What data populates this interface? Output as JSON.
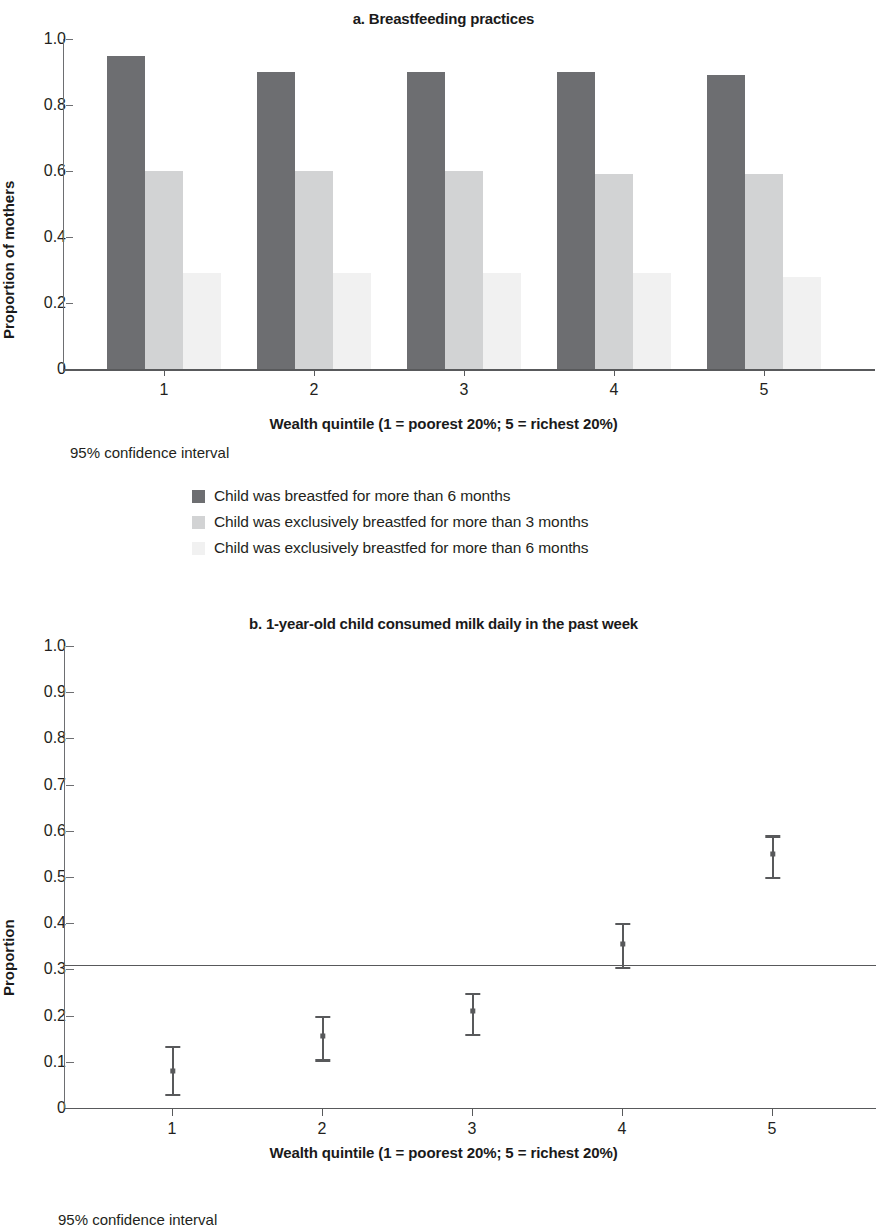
{
  "chart_data": [
    {
      "type": "bar",
      "panel_id": "a",
      "title": "a. Breastfeeding practices",
      "xlabel": "Wealth quintile (1 = poorest 20%; 5 = richest 20%)",
      "ylabel": "Proportion of mothers",
      "categories": [
        "1",
        "2",
        "3",
        "4",
        "5"
      ],
      "ylim": [
        0,
        1.0
      ],
      "ytick_labels": [
        "0",
        "0.2",
        "0.4",
        "0.6",
        "0.8",
        "1.0"
      ],
      "ytick_values": [
        0,
        0.2,
        0.4,
        0.6,
        0.8,
        1.0
      ],
      "grid": false,
      "legend_position": "below",
      "note": "95% confidence interval",
      "series": [
        {
          "name": "Child was breastfed for more than 6 months",
          "color": "#6d6e71",
          "values": [
            0.95,
            0.9,
            0.9,
            0.9,
            0.89
          ]
        },
        {
          "name": "Child was exclusively breastfed for more than 3 months",
          "color": "#d2d3d4",
          "values": [
            0.6,
            0.6,
            0.6,
            0.59,
            0.59
          ]
        },
        {
          "name": "Child was exclusively breastfed for more than 6 months",
          "color": "#f1f1f1",
          "values": [
            0.29,
            0.29,
            0.29,
            0.29,
            0.28
          ]
        }
      ]
    },
    {
      "type": "scatter",
      "panel_id": "b",
      "title": "b. 1-year-old child consumed milk daily in the past week",
      "xlabel": "Wealth quintile (1 = poorest 20%; 5 = richest 20%)",
      "ylabel": "Proportion",
      "categories": [
        "1",
        "2",
        "3",
        "4",
        "5"
      ],
      "ylim": [
        0,
        1.0
      ],
      "ytick_labels": [
        "0",
        "0.1",
        "0.2",
        "0.3",
        "0.4",
        "0.5",
        "0.6",
        "0.7",
        "0.8",
        "0.9",
        "1.0"
      ],
      "ytick_values": [
        0,
        0.1,
        0.2,
        0.3,
        0.4,
        0.5,
        0.6,
        0.7,
        0.8,
        0.9,
        1.0
      ],
      "grid": false,
      "note": "95% confidence interval",
      "reference_line": 0.31,
      "series": [
        {
          "name": "Proportion consuming milk daily",
          "color": "#58595b",
          "values": [
            0.08,
            0.155,
            0.21,
            0.355,
            0.55
          ],
          "ci_low": [
            0.03,
            0.105,
            0.16,
            0.305,
            0.5
          ],
          "ci_high": [
            0.135,
            0.2,
            0.25,
            0.4,
            0.59
          ]
        }
      ]
    }
  ],
  "panel_a": {
    "title": "a. Breastfeeding practices",
    "y_axis_title": "Proportion of mothers",
    "x_axis_title": "Wealth quintile (1 = poorest 20%; 5 = richest 20%)",
    "ci_note": "95% confidence interval",
    "y_ticks": [
      "1.0",
      "0.8",
      "0.6",
      "0.4",
      "0.2",
      "0"
    ],
    "x_ticks": [
      "1",
      "2",
      "3",
      "4",
      "5"
    ],
    "legend": [
      "Child was breastfed for more than 6 months",
      "Child was exclusively breastfed for more than 3 months",
      "Child was exclusively breastfed for more than 6 months"
    ]
  },
  "panel_b": {
    "title": "b. 1-year-old child consumed milk daily in the past week",
    "y_axis_title": "Proportion",
    "x_axis_title": "Wealth quintile (1 = poorest 20%; 5 = richest 20%)",
    "ci_note": "95% confidence interval",
    "y_ticks": [
      "1.0",
      "0.9",
      "0.8",
      "0.7",
      "0.6",
      "0.5",
      "0.4",
      "0.3",
      "0.2",
      "0.1",
      "0"
    ],
    "x_ticks": [
      "1",
      "2",
      "3",
      "4",
      "5"
    ]
  }
}
